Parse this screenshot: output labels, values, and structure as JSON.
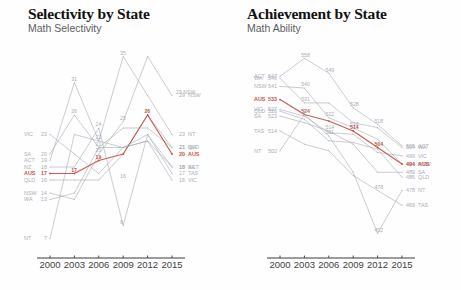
{
  "panels": [
    {
      "id": "selectivity",
      "title": "Selectivity by State",
      "subtitle": "Math Selectivity",
      "highlight_color": "#c7534a",
      "muted_color": "#9aa0ab",
      "chart_data": {
        "type": "line",
        "title": "Selectivity by State",
        "subtitle": "Math Selectivity",
        "xlabel": "",
        "ylabel": "",
        "x": [
          2000,
          2003,
          2006,
          2009,
          2012,
          2015
        ],
        "xticklabels": [
          "2000",
          "2003",
          "2006",
          "2009",
          "2012",
          "2015"
        ],
        "ylim": [
          6,
          36
        ],
        "grid": false,
        "legend": "edge-labels",
        "series": [
          {
            "name": "NT",
            "values": [
              7,
              23,
              22,
              35,
              29,
              23
            ],
            "highlight": false,
            "left_label": "NT",
            "left_value": "7",
            "right_label": "NT",
            "right_value": "23"
          },
          {
            "name": "WA",
            "values": [
              13,
              14,
              21,
              24,
              24,
              21
            ],
            "highlight": false,
            "left_label": "WA",
            "left_value": "13",
            "right_label": "WA",
            "right_value": "21"
          },
          {
            "name": "QLD",
            "values": [
              16,
              16,
              16,
              20,
              26,
              21
            ],
            "highlight": false,
            "left_label": "QLD",
            "left_value": "16",
            "right_label": "QLD",
            "right_value": "21"
          },
          {
            "name": "AUS",
            "values": [
              17,
              17,
              19,
              20,
              26,
              20
            ],
            "highlight": true,
            "left_label": "AUS",
            "left_value": "17",
            "right_label": "AUS",
            "right_value": "20"
          },
          {
            "name": "SA",
            "values": [
              20,
              26,
              21,
              21,
              23,
              18
            ],
            "highlight": false,
            "left_label": "SA",
            "left_value": "20",
            "right_label": "SA",
            "right_value": "18"
          },
          {
            "name": "ACT",
            "values": [
              19,
              31,
              22,
              21,
              22,
              18
            ],
            "highlight": false,
            "left_label": "ACT",
            "left_value": "19",
            "right_label": "ACT",
            "right_value": "18"
          },
          {
            "name": "TAS",
            "values": [
              18,
              18,
              24,
              9,
              23,
              17
            ],
            "highlight": false,
            "left_label": "NZ",
            "left_value": "18",
            "right_label": "TAS",
            "right_value": "17"
          },
          {
            "name": "VIC",
            "values": [
              23,
              20,
              17,
              21,
              22,
              16
            ],
            "highlight": false,
            "left_label": "VIC",
            "left_value": "23",
            "right_label": "VIC",
            "right_value": "16"
          },
          {
            "name": "NSW",
            "values": [
              14,
              13,
              20,
              25,
              35,
              29
            ],
            "highlight": false,
            "left_label": "NSW",
            "left_value": "14",
            "right_label": "NSW",
            "right_value": "29"
          }
        ],
        "inner_labels": [
          {
            "text": "35",
            "x": 2009,
            "y": 35
          },
          {
            "text": "31",
            "x": 2003,
            "y": 31
          },
          {
            "text": "26",
            "x": 2012,
            "y": 26,
            "highlight": true
          },
          {
            "text": "26",
            "x": 2003,
            "y": 26
          },
          {
            "text": "25",
            "x": 2009,
            "y": 25
          },
          {
            "text": "24",
            "x": 2006,
            "y": 24
          },
          {
            "text": "22",
            "x": 2006,
            "y": 22
          },
          {
            "text": "21",
            "x": 2006,
            "y": 21
          },
          {
            "text": "20",
            "x": 2006,
            "y": 20
          },
          {
            "text": "19",
            "x": 2006,
            "y": 19,
            "highlight": true
          },
          {
            "text": "17",
            "x": 2003,
            "y": 17,
            "highlight": true
          },
          {
            "text": "16",
            "x": 2009,
            "y": 16
          },
          {
            "text": "9",
            "x": 2009,
            "y": 9
          },
          {
            "text": "29",
            "x": 2015,
            "y": 29,
            "edge": true,
            "label": "NSW"
          }
        ]
      }
    },
    {
      "id": "achievement",
      "title": "Achievement by State",
      "subtitle": "Math Ability",
      "highlight_color": "#c7534a",
      "muted_color": "#9aa0ab",
      "chart_data": {
        "type": "line",
        "title": "Achievement by State",
        "subtitle": "Math Ability",
        "xlabel": "",
        "ylabel": "",
        "x": [
          2000,
          2003,
          2006,
          2009,
          2012,
          2015
        ],
        "xticklabels": [
          "2000",
          "2003",
          "2006",
          "2009",
          "2012",
          "2015"
        ],
        "ylim": [
          448,
          560
        ],
        "grid": false,
        "legend": "edge-labels",
        "series": [
          {
            "name": "ACT",
            "values": [
              547,
              558,
              549,
              528,
              518,
              505
            ],
            "highlight": false,
            "left_label": "ACT",
            "left_value": "547",
            "right_label": "ACT",
            "right_value": "505"
          },
          {
            "name": "WA",
            "values": [
              546,
              531,
              531,
              519,
              516,
              504
            ],
            "highlight": false,
            "left_label": "WA",
            "left_value": "546",
            "right_label": "WA",
            "right_value": "504"
          },
          {
            "name": "NSW",
            "values": [
              541,
              540,
              522,
              516,
              509,
              494
            ],
            "highlight": false,
            "left_label": "NSW",
            "left_value": "541",
            "right_label": "NSW",
            "right_value": "494"
          },
          {
            "name": "AUS",
            "values": [
              533,
              524,
              520,
              514,
              504,
              494
            ],
            "highlight": true,
            "left_label": "AUS",
            "left_value": "533",
            "right_label": "AUS",
            "right_value": "494"
          },
          {
            "name": "VIC",
            "values": [
              527,
              523,
              513,
              512,
              501,
              499
            ],
            "highlight": false,
            "left_label": "VIC",
            "left_value": "527",
            "right_label": "VIC",
            "right_value": "499"
          },
          {
            "name": "QLD",
            "values": [
              526,
              521,
              508,
              507,
              503,
              486
            ],
            "highlight": false,
            "left_label": "QLD",
            "left_value": "526",
            "right_label": "QLD",
            "right_value": "486"
          },
          {
            "name": "SA",
            "values": [
              523,
              519,
              514,
              506,
              489,
              489
            ],
            "highlight": false,
            "left_label": "SA",
            "left_value": "523",
            "right_label": "SA",
            "right_value": "489"
          },
          {
            "name": "TAS",
            "values": [
              514,
              506,
              502,
              487,
              478,
              469
            ],
            "highlight": false,
            "left_label": "TAS",
            "left_value": "514",
            "right_label": "TAS",
            "right_value": "469"
          },
          {
            "name": "NT",
            "values": [
              502,
              524,
              511,
              489,
              452,
              478
            ],
            "highlight": false,
            "left_label": "NT",
            "left_value": "502",
            "right_label": "NT",
            "right_value": "478"
          }
        ],
        "inner_labels": [
          {
            "text": "558",
            "x": 2003,
            "y": 558
          },
          {
            "text": "540",
            "x": 2003,
            "y": 540
          },
          {
            "text": "531",
            "x": 2003,
            "y": 531
          },
          {
            "text": "524",
            "x": 2003,
            "y": 524,
            "highlight": true
          },
          {
            "text": "524",
            "x": 2003,
            "y": 524
          },
          {
            "text": "549",
            "x": 2006,
            "y": 549
          },
          {
            "text": "522",
            "x": 2006,
            "y": 522
          },
          {
            "text": "514",
            "x": 2006,
            "y": 514
          },
          {
            "text": "511",
            "x": 2006,
            "y": 511
          },
          {
            "text": "528",
            "x": 2009,
            "y": 528
          },
          {
            "text": "516",
            "x": 2009,
            "y": 516
          },
          {
            "text": "514",
            "x": 2009,
            "y": 514,
            "highlight": true
          },
          {
            "text": "518",
            "x": 2012,
            "y": 518
          },
          {
            "text": "504",
            "x": 2012,
            "y": 504,
            "highlight": true
          },
          {
            "text": "478",
            "x": 2012,
            "y": 478
          },
          {
            "text": "452",
            "x": 2012,
            "y": 452
          }
        ]
      }
    }
  ]
}
